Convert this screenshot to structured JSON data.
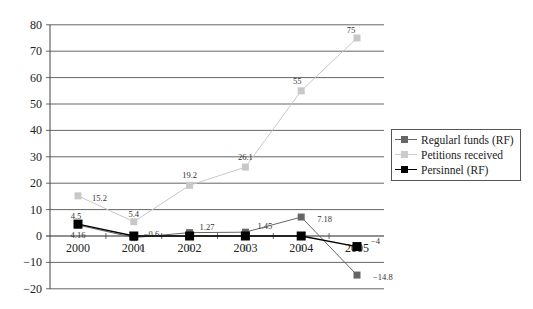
{
  "chart_data": {
    "type": "line",
    "title": "",
    "xlabel": "",
    "ylabel": "",
    "categories": [
      "2000",
      "2001",
      "2002",
      "2003",
      "2004",
      "2005"
    ],
    "ylim": [
      -20,
      80
    ],
    "yticks": [
      -20,
      -10,
      0,
      10,
      20,
      30,
      40,
      50,
      60,
      70,
      80
    ],
    "grid": true,
    "legend_position": "right",
    "series": [
      {
        "name": "Regularl funds (RF)",
        "color": "#666666",
        "values": [
          4.16,
          -0.6,
          1.27,
          1.45,
          7.18,
          -14.8
        ],
        "labels": [
          "4.16",
          "-0.6",
          "1.27",
          "1.45",
          "7.18",
          "-14.8"
        ]
      },
      {
        "name": "Petitions received",
        "color": "#c8c8c8",
        "values": [
          15.2,
          5.4,
          19.2,
          26.1,
          55,
          75
        ],
        "labels": [
          "15.2",
          "5.4",
          "19.2",
          "26.1",
          "55",
          "75"
        ]
      },
      {
        "name": "Persinnel (RF)",
        "color": "#000000",
        "values": [
          4.5,
          0,
          0,
          0,
          0,
          -4
        ],
        "labels": [
          "4.5",
          "0",
          "0",
          "0",
          "0",
          "-4"
        ]
      }
    ]
  },
  "legend": {
    "items": [
      {
        "label": "Regularl funds (RF)"
      },
      {
        "label": "Petitions received"
      },
      {
        "label": "Persinnel (RF)"
      }
    ]
  }
}
